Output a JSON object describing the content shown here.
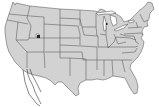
{
  "map": {
    "region": "United States (contiguous)",
    "style": {
      "land_fill": "#d2d2d2",
      "border_color": "#4a4a4a",
      "background": "#ffffff",
      "water_fill": "#ffffff"
    },
    "markers": [
      {
        "name": "utah-marker",
        "x": 38,
        "y": 37
      },
      {
        "name": "michigan-marker",
        "x": 106,
        "y": 24
      }
    ],
    "features": [
      "state-borders",
      "great-lakes",
      "baja-california-outline"
    ]
  }
}
